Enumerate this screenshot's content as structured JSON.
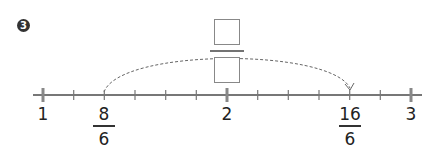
{
  "problem": {
    "number": "3"
  },
  "number_line": {
    "start_label": "1",
    "mid_label": "2",
    "end_label": "3",
    "marked_points": [
      {
        "numerator": "8",
        "denominator": "6"
      },
      {
        "numerator": "16",
        "denominator": "6"
      }
    ],
    "subdivisions_per_unit": 6
  },
  "answer_fraction": {
    "numerator": "",
    "denominator": ""
  },
  "colors": {
    "axis": "#777777",
    "text": "#222222",
    "arc": "#666666"
  }
}
